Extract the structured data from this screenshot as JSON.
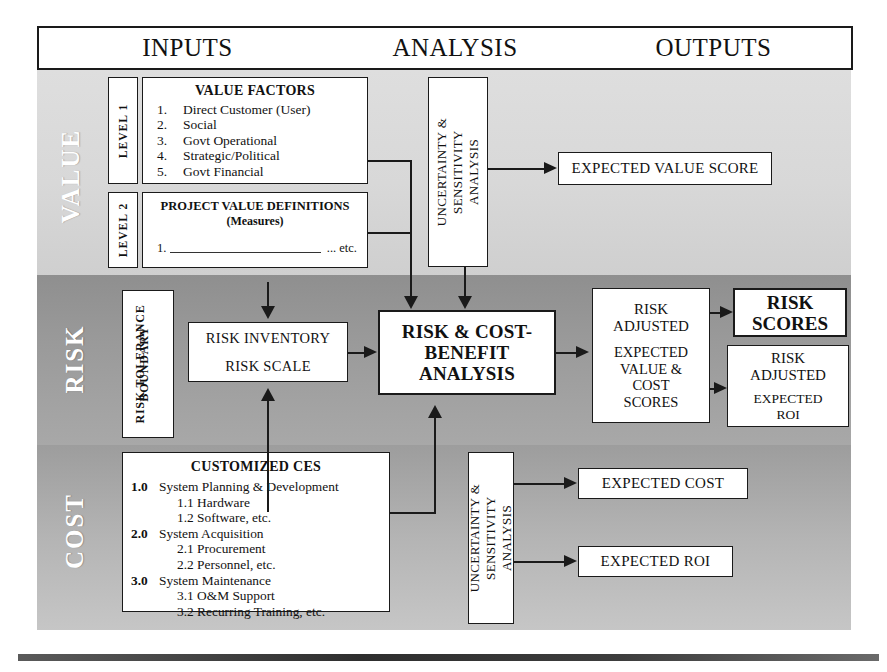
{
  "header": {
    "columns": [
      {
        "id": "inputs",
        "label": "INPUTS"
      },
      {
        "id": "analysis",
        "label": "ANALYSIS"
      },
      {
        "id": "outputs",
        "label": "OUTPUTS"
      }
    ]
  },
  "lanes": [
    {
      "id": "value",
      "label": "VALUE"
    },
    {
      "id": "risk",
      "label": "RISK"
    },
    {
      "id": "cost",
      "label": "COST"
    }
  ],
  "value_row": {
    "level1": {
      "tab": "LEVEL 1",
      "title": "VALUE FACTORS",
      "items": [
        {
          "num": "1.",
          "text": "Direct Customer (User)"
        },
        {
          "num": "2.",
          "text": "Social"
        },
        {
          "num": "3.",
          "text": "Govt Operational"
        },
        {
          "num": "4.",
          "text": "Strategic/Political"
        },
        {
          "num": "5.",
          "text": "Govt Financial"
        }
      ]
    },
    "level2": {
      "tab": "LEVEL 2",
      "title": "PROJECT VALUE DEFINITIONS",
      "subtitle": "(Measures)",
      "item_num": "1.",
      "item_etc": "... etc."
    },
    "uncertainty": {
      "line1": "UNCERTAINTY &",
      "line2": "SENSITIVITY",
      "line3": "ANALYSIS"
    },
    "output": "EXPECTED VALUE SCORE"
  },
  "risk_row": {
    "tolerance_boundary": {
      "line1": "RISK TOLERANCE",
      "line2": "BOUNDARY"
    },
    "inventory": {
      "line1": "RISK INVENTORY",
      "line2": "RISK SCALE"
    },
    "analysis": {
      "line1": "RISK & COST-",
      "line2": "BENEFIT",
      "line3": "ANALYSIS"
    },
    "risk_adjusted": {
      "line1": "RISK",
      "line2": "ADJUSTED",
      "line3": "EXPECTED",
      "line4": "VALUE &",
      "line5": "COST",
      "line6": "SCORES"
    },
    "risk_scores": {
      "line1": "RISK",
      "line2": "SCORES"
    },
    "risk_adjusted_roi": {
      "line1": "RISK",
      "line2": "ADJUSTED",
      "line3": "EXPECTED",
      "line4": "ROI"
    }
  },
  "cost_row": {
    "ces": {
      "title": "CUSTOMIZED CES",
      "items": [
        {
          "num": "1.0",
          "text": "System Planning & Development",
          "sub": false
        },
        {
          "num": "",
          "text": "1.1 Hardware",
          "sub": true
        },
        {
          "num": "",
          "text": "1.2 Software, etc.",
          "sub": true
        },
        {
          "num": "2.0",
          "text": "System Acquisition",
          "sub": false
        },
        {
          "num": "",
          "text": "2.1 Procurement",
          "sub": true
        },
        {
          "num": "",
          "text": "2.2 Personnel, etc.",
          "sub": true
        },
        {
          "num": "3.0",
          "text": "System Maintenance",
          "sub": false
        },
        {
          "num": "",
          "text": "3.1 O&M Support",
          "sub": true
        },
        {
          "num": "",
          "text": "3.2 Recurring Training, etc.",
          "sub": true
        }
      ]
    },
    "uncertainty": {
      "line1": "UNCERTAINTY &",
      "line2": "SENSITIVITY",
      "line3": "ANALYSIS"
    },
    "outputs": [
      {
        "id": "expected-cost",
        "label": "EXPECTED COST"
      },
      {
        "id": "expected-roi",
        "label": "EXPECTED ROI"
      }
    ]
  },
  "colors": {
    "ink": "#1a1a1a",
    "value_band": "#d8d8d8",
    "risk_band": "#9a9a9a",
    "cost_band": "#b4b4b4",
    "box_fill": "#ffffff"
  }
}
